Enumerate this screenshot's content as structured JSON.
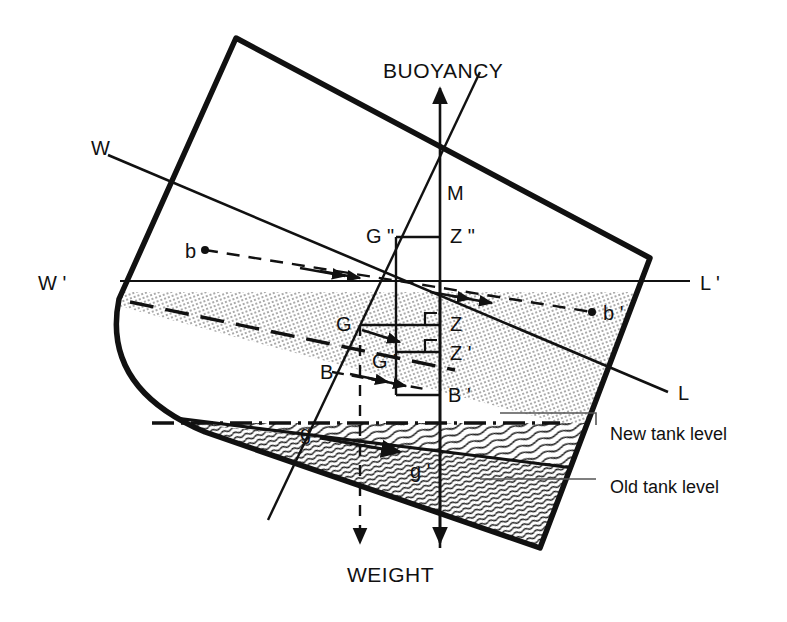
{
  "figure": {
    "kind": "naval-stability-diagram",
    "background_color": "#ffffff",
    "ink_color": "#111111",
    "width": 787,
    "height": 622
  },
  "labels": {
    "buoyancy": "BUOYANCY",
    "weight": "WEIGHT",
    "waterline_w": "W",
    "waterline_l": "L",
    "waterline_w_prime": "W",
    "waterline_l_prime": "L",
    "prime_mark": "'",
    "double_prime_mark": "\"",
    "metacenter": "M",
    "b_old": "b",
    "b_new": "b",
    "B_old": "B",
    "B_new": "B",
    "G": "G",
    "G_prime": "G",
    "G_double_prime": "G",
    "Z": "Z",
    "Z_prime": "Z",
    "Z_double_prime": "Z",
    "g_old": "g",
    "g_new": "g",
    "new_tank_level": "New tank level",
    "old_tank_level": "Old tank level"
  },
  "composed_labels": {
    "w_prime": "W '",
    "l_prime": "L '",
    "b_prime": "b '",
    "B_prime": "B '",
    "G_prime": "G '",
    "G_double_prime": "G \"",
    "Z_plain": "Z",
    "Z_prime": "Z '",
    "Z_double_prime": "Z \"",
    "g_prime": "g '"
  },
  "annotations": {
    "new_tank_level": "New tank level",
    "old_tank_level": "Old tank level"
  },
  "geometry": {
    "hull_outline": "M 236,38 L 650,258 L 540,548 L 200,430 Q 100,390 118,300 Z",
    "hull_stroke_width": 5,
    "waterline_level_y": 281,
    "tilt_degrees": 18
  }
}
